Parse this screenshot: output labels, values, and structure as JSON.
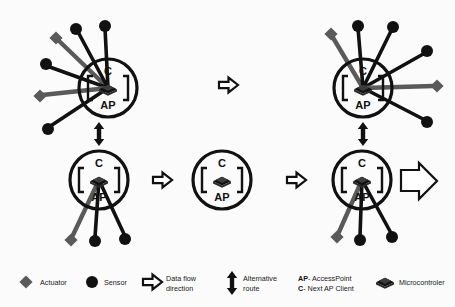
{
  "figure": {
    "background_color": "#fbfbfb",
    "ink_color": "#111111",
    "actuator_color": "#5a5a5a",
    "sensor_color": "#111111"
  },
  "node_labels": {
    "client": "C",
    "access_point": "AP"
  },
  "nodes": [
    {
      "id": "node-top-left",
      "label_top": "C",
      "label_bottom": "AP",
      "position": "top-left",
      "peripheral_count": 6,
      "peripherals": [
        "actuator",
        "sensor",
        "sensor",
        "sensor",
        "actuator",
        "sensor"
      ]
    },
    {
      "id": "node-bottom-left",
      "label_top": "C",
      "label_bottom": "AP",
      "position": "bottom-left",
      "peripheral_count": 3,
      "peripherals": [
        "actuator",
        "sensor",
        "sensor"
      ]
    },
    {
      "id": "node-center",
      "label_top": "C",
      "label_bottom": "AP",
      "position": "center",
      "peripheral_count": 0,
      "peripherals": []
    },
    {
      "id": "node-top-right",
      "label_top": "C",
      "label_bottom": "AP",
      "position": "top-right",
      "peripheral_count": 6,
      "peripherals": [
        "actuator",
        "sensor",
        "sensor",
        "sensor",
        "actuator",
        "sensor"
      ]
    },
    {
      "id": "node-bottom-right",
      "label_top": "C",
      "label_bottom": "AP",
      "position": "bottom-right",
      "peripheral_count": 3,
      "peripherals": [
        "actuator",
        "sensor",
        "sensor"
      ]
    }
  ],
  "connectors": [
    {
      "id": "arrow-top-middle",
      "type": "data-flow",
      "direction": "right"
    },
    {
      "id": "arrow-left-to-center",
      "type": "data-flow",
      "direction": "right"
    },
    {
      "id": "arrow-center-to-right",
      "type": "data-flow",
      "direction": "right"
    },
    {
      "id": "arrow-bottom-right-out",
      "type": "data-flow",
      "direction": "right"
    },
    {
      "id": "arrow-left-alternative",
      "type": "alternative-route",
      "direction": "vertical-bidirectional"
    },
    {
      "id": "arrow-right-alternative",
      "type": "alternative-route",
      "direction": "vertical-bidirectional"
    }
  ],
  "legend": {
    "items": [
      {
        "id": "legend-actuator",
        "icon": "diamond-icon",
        "label_line1": "Actuator",
        "label_line2": ""
      },
      {
        "id": "legend-sensor",
        "icon": "circle-icon",
        "label_line1": "Sensor",
        "label_line2": ""
      },
      {
        "id": "legend-data-flow",
        "icon": "hollow-arrow-icon",
        "label_line1": "Data flow",
        "label_line2": "direction"
      },
      {
        "id": "legend-alternative",
        "icon": "double-arrow-icon",
        "label_line1": "Alternative",
        "label_line2": "route"
      },
      {
        "id": "legend-abbreviations",
        "icon": "none",
        "label_line1": "AP- AccessPoint",
        "label_line2": "C- Next AP Client",
        "bold_prefix_line1": "AP",
        "rest_line1": "- AccessPoint",
        "bold_prefix_line2": "C",
        "rest_line2": "- Next AP Client"
      },
      {
        "id": "legend-microcontroller",
        "icon": "chip-icon",
        "label_line1": "Microcontroler",
        "label_line2": ""
      }
    ]
  }
}
